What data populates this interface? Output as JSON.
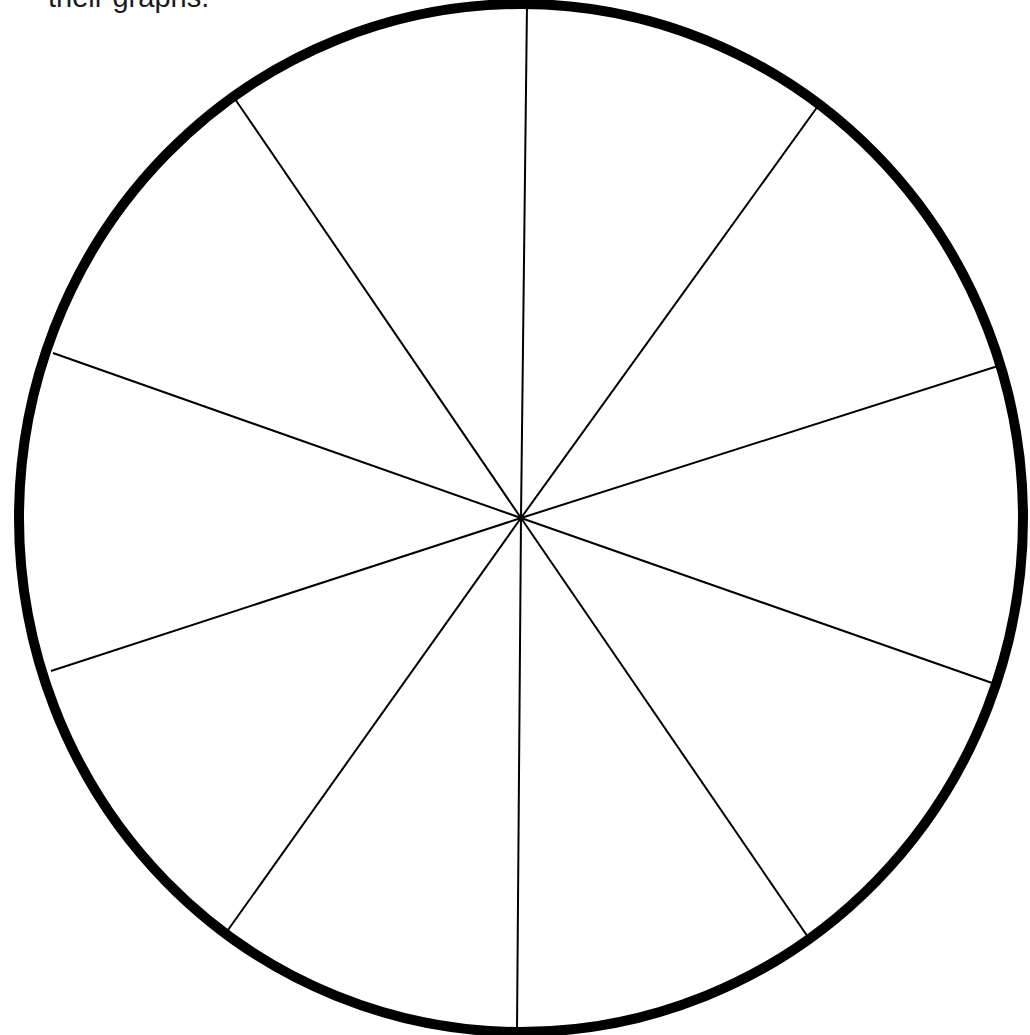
{
  "caption": {
    "text": "their graphs."
  },
  "chart_data": {
    "type": "pie",
    "title": "",
    "subtitle": "",
    "categories": [
      "",
      "",
      "",
      "",
      "",
      "",
      "",
      "",
      "",
      ""
    ],
    "values": [
      10,
      10,
      10,
      10,
      10,
      10,
      10,
      10,
      10,
      10
    ],
    "segment_count": 10,
    "labels_visible": false,
    "legend": null,
    "fill": "#ffffff",
    "outline_color": "#000000",
    "divider_color": "#000000",
    "center": [
      521,
      518
    ],
    "radius": [
      502,
      514
    ],
    "spoke_endpoints": [
      [
        527,
        4
      ],
      [
        818,
        106
      ],
      [
        998,
        366
      ],
      [
        995,
        684
      ],
      [
        810,
        940
      ],
      [
        517,
        1031
      ],
      [
        228,
        930
      ],
      [
        51,
        671
      ],
      [
        53,
        353
      ],
      [
        235,
        99
      ]
    ],
    "outline_width": 10,
    "divider_width": 2
  }
}
